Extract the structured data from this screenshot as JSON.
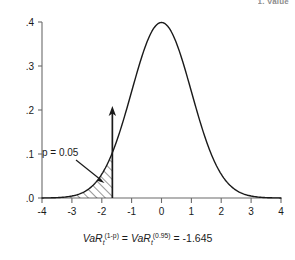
{
  "running_head": "1. Value",
  "chart_data": {
    "type": "line",
    "title": "",
    "subtitle": "",
    "xlabel": "",
    "ylabel": "",
    "xlim": [
      -4,
      4
    ],
    "ylim": [
      0,
      0.4
    ],
    "grid": false,
    "legend": null,
    "x_ticks": [
      -4,
      -3,
      -2,
      -1,
      0,
      1,
      2,
      3,
      4
    ],
    "x_tick_labels": [
      "-4",
      "-3",
      "-2",
      "-1",
      "0",
      "1",
      "2",
      "3",
      "4"
    ],
    "y_ticks": [
      0.0,
      0.1,
      0.2,
      0.3,
      0.4
    ],
    "y_tick_labels": [
      ".0",
      ".1",
      ".2",
      ".3",
      ".4"
    ],
    "series": [
      {
        "name": "standard normal density",
        "x": [
          -4.0,
          -3.8,
          -3.6,
          -3.4,
          -3.2,
          -3.0,
          -2.8,
          -2.6,
          -2.4,
          -2.2,
          -2.0,
          -1.8,
          -1.645,
          -1.6,
          -1.4,
          -1.2,
          -1.0,
          -0.8,
          -0.6,
          -0.4,
          -0.2,
          0.0,
          0.2,
          0.4,
          0.6,
          0.8,
          1.0,
          1.2,
          1.4,
          1.6,
          1.8,
          2.0,
          2.2,
          2.4,
          2.6,
          2.8,
          3.0,
          3.2,
          3.4,
          3.6,
          3.8,
          4.0
        ],
        "y": [
          0.0001,
          0.0003,
          0.0006,
          0.0012,
          0.0024,
          0.0044,
          0.0079,
          0.0136,
          0.0224,
          0.0355,
          0.054,
          0.079,
          0.1031,
          0.1109,
          0.1497,
          0.1942,
          0.242,
          0.2897,
          0.3332,
          0.3683,
          0.391,
          0.3989,
          0.391,
          0.3683,
          0.3332,
          0.2897,
          0.242,
          0.1942,
          0.1497,
          0.1109,
          0.079,
          0.054,
          0.0355,
          0.0224,
          0.0136,
          0.0079,
          0.0044,
          0.0024,
          0.0012,
          0.0006,
          0.0003,
          0.0001
        ]
      }
    ],
    "shaded_region": {
      "label": "p = 0.05",
      "from": -4,
      "to": -1.645,
      "area": 0.05,
      "hatch": "diagonal"
    },
    "vertical_line": {
      "x": -1.645,
      "label": "",
      "arrow": true
    },
    "annotations": [
      {
        "text": "p = 0.05",
        "x": -2.85,
        "y": 0.115
      }
    ]
  },
  "caption": {
    "var_symbol": "VaR",
    "subscript": "t",
    "exponent_left": "(1-p)",
    "equals": "=",
    "exponent_right": "(0.95)",
    "value": "-1.645",
    "full_text": "VaR_t^(1-p) = VaR_t^(0.95) = -1.645"
  }
}
